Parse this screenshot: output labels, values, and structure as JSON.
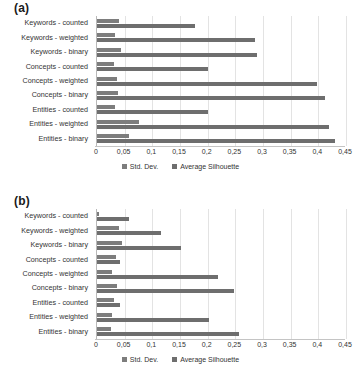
{
  "panels": [
    {
      "label": "(a)"
    },
    {
      "label": "(b)"
    }
  ],
  "legend": {
    "items": [
      {
        "label": "Std. Dev.",
        "color": "#7d7d7d"
      },
      {
        "label": "Average Silhouette",
        "color": "#6e6e6e"
      }
    ]
  },
  "axis": {
    "ticks": [
      "0",
      "0,05",
      "0,1",
      "0,15",
      "0,2",
      "0,25",
      "0,3",
      "0,35",
      "0,4",
      "0,45"
    ]
  },
  "chart_data": [
    {
      "type": "bar",
      "title": "(a)",
      "orientation": "horizontal",
      "categories": [
        "Keywords - counted",
        "Keywords - weighted",
        "Keywords - binary",
        "Concepts - counted",
        "Concepts - weighted",
        "Concepts - binary",
        "Entities - counted",
        "Entities - weighted",
        "Entities - binary"
      ],
      "series": [
        {
          "name": "Std. Dev.",
          "color": "#7d7d7d",
          "values": [
            0.04,
            0.033,
            0.043,
            0.031,
            0.036,
            0.038,
            0.033,
            0.075,
            0.057
          ]
        },
        {
          "name": "Average Silhouette",
          "color": "#6e6e6e",
          "values": [
            0.178,
            0.285,
            0.29,
            0.2,
            0.398,
            0.412,
            0.2,
            0.419,
            0.431
          ]
        }
      ],
      "xlabel": "",
      "ylabel": "",
      "xlim": [
        0,
        0.45
      ],
      "xticks": [
        0,
        0.05,
        0.1,
        0.15,
        0.2,
        0.25,
        0.3,
        0.35,
        0.4,
        0.45
      ],
      "xtick_labels": [
        "0",
        "0,05",
        "0,1",
        "0,15",
        "0,2",
        "0,25",
        "0,3",
        "0,35",
        "0,4",
        "0,45"
      ],
      "grid": true,
      "legend_position": "bottom"
    },
    {
      "type": "bar",
      "title": "(b)",
      "orientation": "horizontal",
      "categories": [
        "Keywords - counted",
        "Keywords - weighted",
        "Keywords - binary",
        "Concepts - counted",
        "Concepts - weighted",
        "Concepts - binary",
        "Entities - counted",
        "Entities - weighted",
        "Entities - binary"
      ],
      "series": [
        {
          "name": "Std. Dev.",
          "color": "#7d7d7d",
          "values": [
            0.003,
            0.039,
            0.045,
            0.034,
            0.027,
            0.036,
            0.03,
            0.028,
            0.026
          ]
        },
        {
          "name": "Average Silhouette",
          "color": "#6e6e6e",
          "values": [
            0.057,
            0.115,
            0.151,
            0.042,
            0.218,
            0.248,
            0.041,
            0.203,
            0.256
          ]
        }
      ],
      "xlabel": "",
      "ylabel": "",
      "xlim": [
        0,
        0.45
      ],
      "xticks": [
        0,
        0.05,
        0.1,
        0.15,
        0.2,
        0.25,
        0.3,
        0.35,
        0.4,
        0.45
      ],
      "xtick_labels": [
        "0",
        "0,05",
        "0,1",
        "0,15",
        "0,2",
        "0,25",
        "0,3",
        "0,35",
        "0,4",
        "0,45"
      ],
      "grid": true,
      "legend_position": "bottom"
    }
  ]
}
